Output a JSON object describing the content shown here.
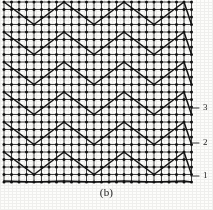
{
  "figure": {
    "caption": "(b)",
    "kind": "lattice-zigzag-diagram",
    "background_color": "#fdfdfb",
    "grid_color": "#2a2a2a",
    "node_color": "#111111",
    "zigzag_color": "#111111",
    "leader_color": "#222222"
  },
  "lattice": {
    "origin_x": 4,
    "origin_y": 2,
    "cell": 7.5,
    "cols": 25,
    "rows": 24,
    "node_radius": 1.5,
    "grid_line_width": 0.9,
    "right_edge_x": 191.5,
    "bottom_edge_y": 181
  },
  "zigzag": {
    "line_width": 1.5,
    "period_x": 60,
    "amplitude_y": 22.5,
    "row_spacing_y": 30,
    "rows_y": [
      2,
      32,
      62,
      92,
      122,
      152,
      181
    ],
    "phase": "peak-at-x-4"
  },
  "labels": [
    {
      "id": "label-3",
      "text": "3",
      "x": 203,
      "y": 108,
      "leader_from_x": 191,
      "leader_to_x": 199,
      "leader_y": 108
    },
    {
      "id": "label-2",
      "text": "2",
      "x": 203,
      "y": 143,
      "leader_from_x": 191,
      "leader_to_x": 199,
      "leader_y": 143
    },
    {
      "id": "label-1",
      "text": "1",
      "x": 203,
      "y": 176,
      "leader_from_x": 191,
      "leader_to_x": 199,
      "leader_y": 176
    }
  ],
  "chart_data": {
    "type": "diagram",
    "title": "(b)",
    "annotations": [
      "3",
      "2",
      "1"
    ]
  }
}
